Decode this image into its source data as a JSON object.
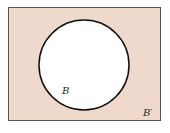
{
  "diagram": {
    "type": "venn",
    "universal_set": {
      "label": "B′",
      "fill": "#efd9cc",
      "stroke": "#555555"
    },
    "sets": [
      {
        "label": "B",
        "fill": "#ffffff",
        "stroke": "#111111"
      }
    ],
    "shaded_region": "complement of B"
  }
}
